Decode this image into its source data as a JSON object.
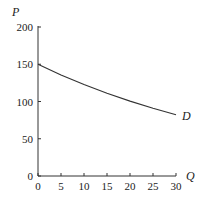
{
  "chart_data": {
    "type": "line",
    "title": "",
    "xlabel": "Q",
    "ylabel": "P",
    "xlim": [
      0,
      30
    ],
    "ylim": [
      0,
      200
    ],
    "x_ticks": [
      0,
      5,
      10,
      15,
      20,
      25,
      30
    ],
    "y_ticks": [
      0,
      50,
      100,
      150,
      200
    ],
    "grid": false,
    "legend": null,
    "series": [
      {
        "name": "D",
        "x": [
          0,
          5,
          10,
          15,
          20,
          25,
          30
        ],
        "values": [
          150,
          135.7,
          122.8,
          111.1,
          100.5,
          91.0,
          82.3
        ]
      }
    ],
    "annotations": [
      {
        "text": "D",
        "x": 30,
        "y": 82
      }
    ],
    "colors": {
      "axis": "#333333",
      "curve": "#333333",
      "text": "#222222"
    }
  }
}
